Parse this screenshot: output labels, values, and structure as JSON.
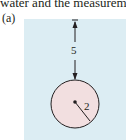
{
  "text": {
    "top_line": "water and the measuremen"
  },
  "figure": {
    "label": "(a)",
    "vertical_distance": "5",
    "radius_label": "2",
    "colors": {
      "panel": "#dcedf3",
      "circle_fill": "#f2dfe0",
      "ink": "#231f20"
    }
  }
}
